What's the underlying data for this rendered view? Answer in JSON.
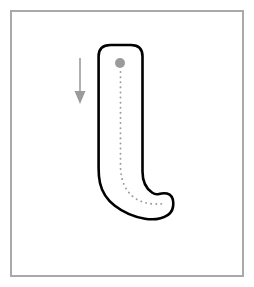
{
  "worksheet": {
    "title": "Letter tracing worksheet",
    "letter": "J",
    "letter_case": "uppercase",
    "instruction": "Trace the letter following the dotted guide from the start dot downward.",
    "background_color": "#ffffff"
  },
  "frame": {
    "name": "worksheet-border",
    "color": "#a9a9a9",
    "thickness_px": 2,
    "inset_px": 10,
    "width_px": 234,
    "height_px": 267
  },
  "letter_outline": {
    "name": "letter-outline-J",
    "stroke_color": "#000000",
    "fill_color": "#ffffff",
    "stroke_width_px": 2.6,
    "bounds": {
      "left_px": 97,
      "top_px": 44,
      "right_px": 175,
      "bottom_px": 219
    }
  },
  "start_dot": {
    "name": "start-dot",
    "color": "#9b9b9b",
    "radius_px": 5,
    "x_px": 120,
    "y_px": 63
  },
  "guide_path": {
    "name": "dotted-guide-path",
    "color": "#9b9b9b",
    "style": "dotted",
    "dot_diameter_px": 1.9,
    "dot_spacing_px": 5,
    "start_x_px": 120,
    "start_y_px": 72,
    "end_x_px": 166,
    "end_y_px": 203
  },
  "direction_arrow": {
    "name": "direction-arrow-down",
    "color": "#9b9b9b",
    "direction": "down",
    "x_px": 80,
    "start_y_px": 58,
    "end_y_px": 104,
    "shaft_width_px": 1.6,
    "head_width_px": 11,
    "head_height_px": 13
  },
  "chart_data": {
    "type": "table",
    "categories": [
      "letter",
      "stroke count",
      "start point",
      "direction"
    ],
    "values": [
      "J",
      1,
      "top of vertical stroke",
      "downward then hook right"
    ]
  }
}
